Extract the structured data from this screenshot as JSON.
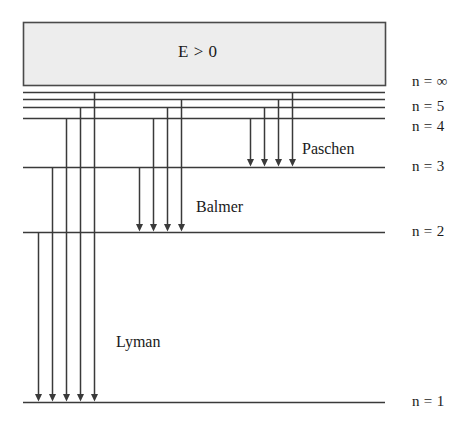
{
  "figure": {
    "type": "energy-level-diagram",
    "background_color": "#ffffff",
    "line_color": "#3a3a3a",
    "text_color": "#1a1a1a"
  },
  "continuum": {
    "label": "E > 0",
    "fill_color": "#ededed",
    "border_color": "#4a4a4a",
    "x": 23,
    "y": 22,
    "width": 362,
    "height": 63
  },
  "levels": [
    {
      "name": "n-infinity",
      "label": "n = ∞",
      "y": 85,
      "line_x1": 23,
      "line_x2": 385,
      "label_x": 412,
      "label_y": 73,
      "draw_line": false
    },
    {
      "name": "n-7",
      "label": "",
      "y": 92,
      "line_x1": 23,
      "line_x2": 385,
      "label_x": 0,
      "label_y": 0,
      "draw_line": true
    },
    {
      "name": "n-6",
      "label": "",
      "y": 99,
      "line_x1": 23,
      "line_x2": 385,
      "label_x": 0,
      "label_y": 0,
      "draw_line": true
    },
    {
      "name": "n-5",
      "label": "n = 5",
      "y": 107,
      "line_x1": 23,
      "line_x2": 385,
      "label_x": 412,
      "label_y": 98,
      "draw_line": true
    },
    {
      "name": "n-4",
      "label": "n = 4",
      "y": 118,
      "line_x1": 23,
      "line_x2": 385,
      "label_x": 412,
      "label_y": 118,
      "draw_line": true
    },
    {
      "name": "n-3",
      "label": "n = 3",
      "y": 167,
      "line_x1": 23,
      "line_x2": 385,
      "label_x": 412,
      "label_y": 158,
      "draw_line": true
    },
    {
      "name": "n-2",
      "label": "n = 2",
      "y": 232,
      "line_x1": 23,
      "line_x2": 385,
      "label_x": 412,
      "label_y": 223,
      "draw_line": true
    },
    {
      "name": "n-1",
      "label": "n = 1",
      "y": 402,
      "line_x1": 23,
      "line_x2": 385,
      "label_x": 412,
      "label_y": 393,
      "draw_line": true
    }
  ],
  "series": [
    {
      "name": "paschen",
      "label": "Paschen",
      "label_x": 302,
      "label_y": 140,
      "target_level_y": 167,
      "transitions": [
        {
          "name": "paschen-4-to-3",
          "x": 250,
          "from_y": 118
        },
        {
          "name": "paschen-5-to-3",
          "x": 264,
          "from_y": 107
        },
        {
          "name": "paschen-6-to-3",
          "x": 278,
          "from_y": 99
        },
        {
          "name": "paschen-7-to-3",
          "x": 292,
          "from_y": 92
        }
      ]
    },
    {
      "name": "balmer",
      "label": "Balmer",
      "label_x": 196,
      "label_y": 198,
      "target_level_y": 232,
      "transitions": [
        {
          "name": "balmer-3-to-2",
          "x": 139,
          "from_y": 167
        },
        {
          "name": "balmer-4-to-2",
          "x": 153,
          "from_y": 118
        },
        {
          "name": "balmer-5-to-2",
          "x": 167,
          "from_y": 107
        },
        {
          "name": "balmer-6-to-2",
          "x": 181,
          "from_y": 99
        }
      ]
    },
    {
      "name": "lyman",
      "label": "Lyman",
      "label_x": 116,
      "label_y": 333,
      "target_level_y": 402,
      "transitions": [
        {
          "name": "lyman-2-to-1",
          "x": 38,
          "from_y": 232
        },
        {
          "name": "lyman-3-to-1",
          "x": 52,
          "from_y": 167
        },
        {
          "name": "lyman-4-to-1",
          "x": 66,
          "from_y": 118
        },
        {
          "name": "lyman-5-to-1",
          "x": 80,
          "from_y": 107
        },
        {
          "name": "lyman-6-to-1",
          "x": 94,
          "from_y": 92
        }
      ]
    }
  ]
}
